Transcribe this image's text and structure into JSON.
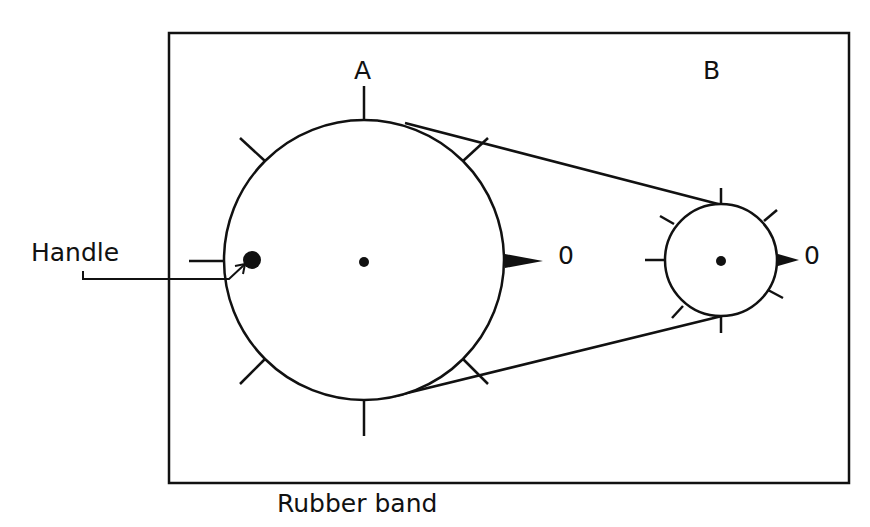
{
  "labels": {
    "pulley_a": "A",
    "pulley_b": "B",
    "handle": "Handle",
    "rubber_band": "Rubber band",
    "zero_a": "0",
    "zero_b": "0"
  },
  "colors": {
    "ink": "#111111",
    "background": "#ffffff"
  }
}
